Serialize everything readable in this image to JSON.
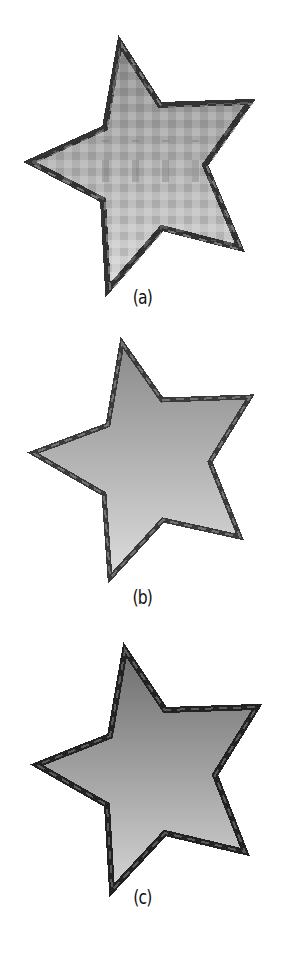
{
  "figure": {
    "panels": [
      {
        "id": "a",
        "label": "(a)",
        "description": "pixelated star with dithered gradient fill",
        "fill_top": "#8c8c8c",
        "fill_bottom": "#d8d8d8",
        "outline": "#333333",
        "dithered": true
      },
      {
        "id": "b",
        "label": "(b)",
        "description": "pixelated star with smooth gradient fill",
        "fill_top": "#8a8a8a",
        "fill_bottom": "#dcdcdc",
        "outline": "#3a3a3a",
        "dithered": false
      },
      {
        "id": "c",
        "label": "(c)",
        "description": "pixelated star with smooth darker gradient fill and crisp outline",
        "fill_top": "#6e6e6e",
        "fill_bottom": "#d4d4d4",
        "outline": "#222222",
        "dithered": false
      }
    ]
  }
}
